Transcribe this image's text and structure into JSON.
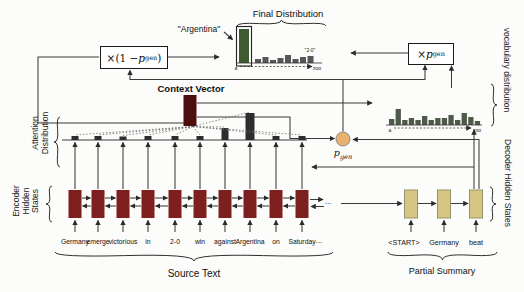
{
  "labels": {
    "final_distribution": "Final Distribution",
    "argentina_callout": "\"Argentina\"",
    "context_vector": "Context Vector",
    "vocabulary_distribution": "vocabulary distribution",
    "decoder_hidden_states": "Decoder Hidden States",
    "attention_line1": "Attention",
    "attention_line2": "Distribution",
    "encoder_line1": "Encoder",
    "encoder_line2": "Hidden",
    "encoder_line3": "States",
    "source_text": "Source Text",
    "partial_summary": "Partial Summary",
    "source_ellipsis": "...",
    "gap_ellipsis": "...",
    "copy_token_label": "\"2-0\""
  },
  "formulas": {
    "one_minus_pgen": {
      "prefix": "×(1 − ",
      "var": "p",
      "sub": "gen",
      "suffix": ")"
    },
    "times_pgen": {
      "prefix": "×",
      "var": "p",
      "sub": "gen",
      "suffix": ""
    },
    "pgen": {
      "var": "p",
      "sub": "gen"
    }
  },
  "source_words": [
    "Germany",
    "emerge",
    "victorious",
    "in",
    "2-0",
    "win",
    "against",
    "Argentina",
    "on",
    "Saturday"
  ],
  "summary_words": [
    "<START>",
    "Germany",
    "beat"
  ],
  "distributions": {
    "attention": {
      "bar_heights": [
        4,
        4,
        3.5,
        4,
        4,
        4,
        12,
        27,
        4,
        4
      ]
    },
    "final": {
      "highlight_bar_height": 34,
      "gray_bar_heights": [
        4,
        6,
        3,
        5,
        8,
        4,
        6,
        7
      ],
      "axis_left": "a",
      "axis_right": "zoo"
    },
    "vocabulary": {
      "bar_heights": [
        6,
        16,
        5,
        7,
        5,
        9,
        5,
        7,
        7,
        10,
        5,
        12,
        8,
        4
      ],
      "axis_left": "a",
      "axis_right": "zoo"
    }
  },
  "colors": {
    "encoder_state": "#7e1f1f",
    "context_vector": "#4d0e0e",
    "decoder_state": "#d6c686",
    "decoder_border": "#99926a",
    "pgen_circle": "#e7b26e",
    "pgen_border": "#8a8a8a",
    "attention_bar": "#2d2d2d",
    "final_gray_bar": "#575757",
    "final_highlight_bar": "#3e5a33",
    "vocab_bar": "#4e5a4a",
    "line": "#3a3a3a"
  }
}
